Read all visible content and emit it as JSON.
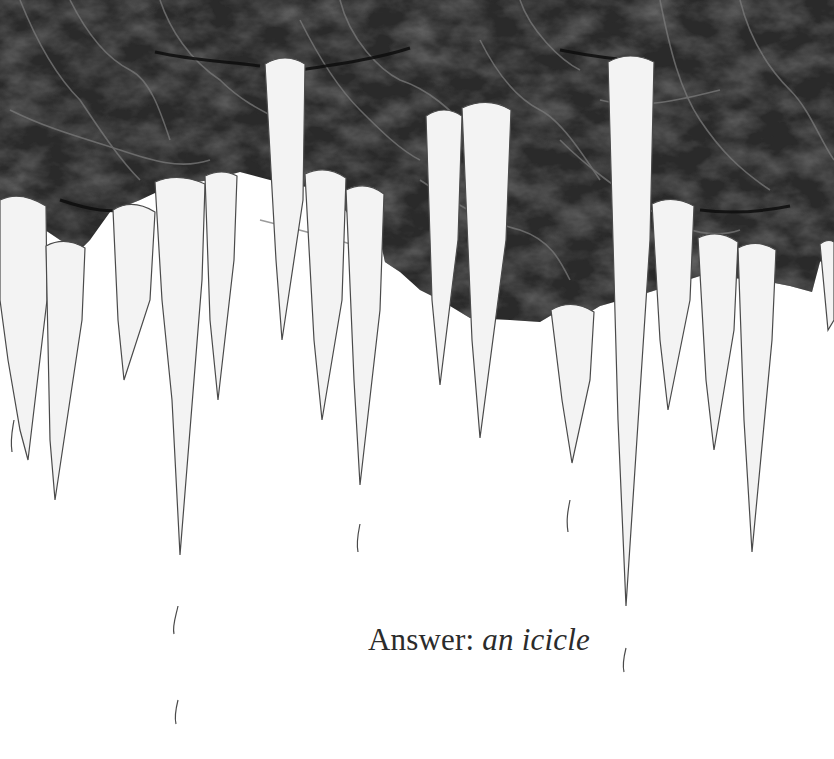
{
  "illustration": {
    "subject": "icicles hanging from dark crinkled paper",
    "colors": {
      "background": "#ffffff",
      "dark_paper": "#2a2a2a",
      "paper_crease": "#6a6a6a",
      "icicle_fill": "#f2f2f2",
      "icicle_line": "#4a4a4a"
    }
  },
  "caption": {
    "label": "Answer:",
    "answer": "an icicle"
  }
}
